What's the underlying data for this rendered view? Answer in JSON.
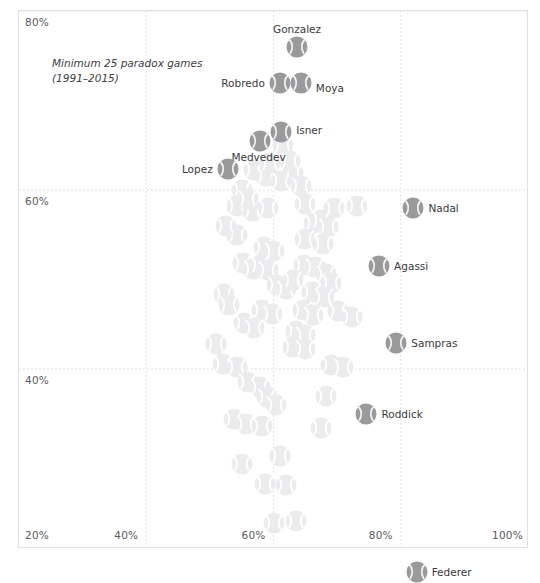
{
  "chart_data": {
    "type": "scatter",
    "title": "",
    "subtitle": "",
    "annotation": "Minimum 25 paradox games\n(1991–2015)",
    "xlabel": "",
    "ylabel": "",
    "xlim": [
      20,
      100
    ],
    "ylim": [
      20,
      80
    ],
    "xticks": [
      "20%",
      "40%",
      "60%",
      "80%",
      "100%"
    ],
    "xtick_values": [
      20,
      40,
      60,
      80,
      100
    ],
    "yticks": [
      "40%",
      "60%",
      "80%"
    ],
    "ytick_values": [
      40,
      60,
      80
    ],
    "grid": true,
    "grid_style": "dotted",
    "legend": "none",
    "marker": "tennis-ball",
    "highlight_color": "#9a9a9c",
    "faded_color": "#ececee",
    "grid_color": "#d9d9dc",
    "frame_color": "#e2e2e4",
    "labeled_points": [
      {
        "name": "Gonzalez",
        "x": 63.7,
        "y": 76.0,
        "label_dx": 0,
        "label_dy": -17,
        "label_align": "center"
      },
      {
        "name": "Robredo",
        "x": 61.0,
        "y": 72.0,
        "label_dx": -15,
        "label_dy": 1,
        "label_align": "right"
      },
      {
        "name": "Moya",
        "x": 64.3,
        "y": 72.0,
        "label_dx": 15,
        "label_dy": 6,
        "label_align": "left"
      },
      {
        "name": "Isner",
        "x": 61.2,
        "y": 66.5,
        "label_dx": 15,
        "label_dy": -1,
        "label_align": "left"
      },
      {
        "name": "Medvedev",
        "x": 57.8,
        "y": 65.5,
        "label_dx": -1,
        "label_dy": 17,
        "label_align": "center"
      },
      {
        "name": "Lopez",
        "x": 52.8,
        "y": 62.3,
        "label_dx": -15,
        "label_dy": 1,
        "label_align": "right"
      },
      {
        "name": "Nadal",
        "x": 82.0,
        "y": 58.0,
        "label_dx": 15,
        "label_dy": 1,
        "label_align": "left"
      },
      {
        "name": "Agassi",
        "x": 76.6,
        "y": 51.5,
        "label_dx": 15,
        "label_dy": 1,
        "label_align": "left"
      },
      {
        "name": "Sampras",
        "x": 79.3,
        "y": 42.9,
        "label_dx": 15,
        "label_dy": 1,
        "label_align": "left"
      },
      {
        "name": "Roddick",
        "x": 74.6,
        "y": 35.0,
        "label_dx": 15,
        "label_dy": 1,
        "label_align": "left"
      },
      {
        "name": "Federer",
        "x": 82.5,
        "y": 17.3,
        "label_dx": 15,
        "label_dy": 1,
        "label_align": "left"
      }
    ],
    "unlabeled_points": [
      {
        "x": 55.0,
        "y": 60.0
      },
      {
        "x": 57.0,
        "y": 62.2
      },
      {
        "x": 58.8,
        "y": 61.6
      },
      {
        "x": 61.2,
        "y": 61.0
      },
      {
        "x": 63.0,
        "y": 61.9
      },
      {
        "x": 64.4,
        "y": 60.4
      },
      {
        "x": 54.3,
        "y": 58.2
      },
      {
        "x": 56.7,
        "y": 57.6
      },
      {
        "x": 59.1,
        "y": 58.0
      },
      {
        "x": 64.9,
        "y": 58.4
      },
      {
        "x": 69.5,
        "y": 58.0
      },
      {
        "x": 73.1,
        "y": 58.2
      },
      {
        "x": 66.3,
        "y": 56.3
      },
      {
        "x": 67.5,
        "y": 56.6
      },
      {
        "x": 68.6,
        "y": 55.9
      },
      {
        "x": 54.2,
        "y": 55.0
      },
      {
        "x": 65.0,
        "y": 54.5
      },
      {
        "x": 67.8,
        "y": 54.0
      },
      {
        "x": 58.5,
        "y": 53.6
      },
      {
        "x": 60.0,
        "y": 53.2
      },
      {
        "x": 55.2,
        "y": 51.8
      },
      {
        "x": 56.8,
        "y": 51.2
      },
      {
        "x": 57.9,
        "y": 51.6
      },
      {
        "x": 59.2,
        "y": 51.1
      },
      {
        "x": 64.8,
        "y": 51.6
      },
      {
        "x": 66.6,
        "y": 51.4
      },
      {
        "x": 68.2,
        "y": 50.6
      },
      {
        "x": 69.0,
        "y": 49.6
      },
      {
        "x": 60.5,
        "y": 49.4
      },
      {
        "x": 62.0,
        "y": 48.9
      },
      {
        "x": 66.0,
        "y": 48.6
      },
      {
        "x": 68.0,
        "y": 48.0
      },
      {
        "x": 52.2,
        "y": 48.4
      },
      {
        "x": 53.0,
        "y": 47.2
      },
      {
        "x": 58.2,
        "y": 46.6
      },
      {
        "x": 59.8,
        "y": 46.2
      },
      {
        "x": 64.6,
        "y": 46.6
      },
      {
        "x": 66.2,
        "y": 46.0
      },
      {
        "x": 70.2,
        "y": 46.5
      },
      {
        "x": 72.4,
        "y": 45.8
      },
      {
        "x": 55.3,
        "y": 45.1
      },
      {
        "x": 57.0,
        "y": 44.6
      },
      {
        "x": 63.5,
        "y": 44.2
      },
      {
        "x": 64.9,
        "y": 43.8
      },
      {
        "x": 51.0,
        "y": 42.8
      },
      {
        "x": 63.0,
        "y": 42.5
      },
      {
        "x": 65.0,
        "y": 42.2
      },
      {
        "x": 52.0,
        "y": 40.6
      },
      {
        "x": 54.2,
        "y": 40.2
      },
      {
        "x": 69.0,
        "y": 40.5
      },
      {
        "x": 71.0,
        "y": 40.2
      },
      {
        "x": 56.0,
        "y": 38.6
      },
      {
        "x": 57.8,
        "y": 38.0
      },
      {
        "x": 59.0,
        "y": 36.9
      },
      {
        "x": 60.4,
        "y": 36.0
      },
      {
        "x": 68.2,
        "y": 37.0
      },
      {
        "x": 53.8,
        "y": 34.4
      },
      {
        "x": 55.6,
        "y": 33.8
      },
      {
        "x": 58.2,
        "y": 33.6
      },
      {
        "x": 67.5,
        "y": 33.4
      },
      {
        "x": 61.0,
        "y": 30.3
      },
      {
        "x": 55.0,
        "y": 29.4
      },
      {
        "x": 58.6,
        "y": 27.2
      },
      {
        "x": 62.0,
        "y": 27.0
      },
      {
        "x": 60.0,
        "y": 22.8
      },
      {
        "x": 63.5,
        "y": 23.0
      },
      {
        "x": 61.5,
        "y": 65.0
      },
      {
        "x": 62.6,
        "y": 63.2
      },
      {
        "x": 59.5,
        "y": 63.0
      },
      {
        "x": 56.0,
        "y": 59.0
      },
      {
        "x": 52.6,
        "y": 56.0
      },
      {
        "x": 63.0,
        "y": 50.0
      }
    ]
  }
}
